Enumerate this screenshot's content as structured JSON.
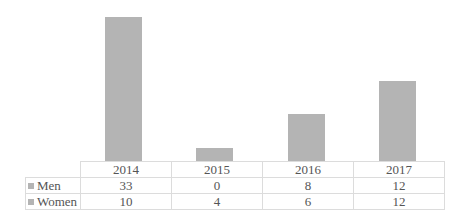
{
  "chart_data": {
    "type": "bar",
    "stacked": true,
    "title": "",
    "xlabel": "",
    "ylabel": "",
    "categories": [
      "2014",
      "2015",
      "2016",
      "2017"
    ],
    "series": [
      {
        "name": "Men",
        "values": [
          33,
          0,
          8,
          12
        ],
        "color": "#b4b4b4"
      },
      {
        "name": "Women",
        "values": [
          10,
          4,
          6,
          12
        ],
        "color": "#b4b4b4"
      }
    ],
    "totals": [
      43,
      4,
      14,
      24
    ],
    "ylim": [
      0,
      48
    ],
    "grid": false,
    "axis_visible": false,
    "legend_position": "data-table-below"
  },
  "table": {
    "headers": [
      "2014",
      "2015",
      "2016",
      "2017"
    ],
    "rows": [
      {
        "label": "Men",
        "values": [
          "33",
          "0",
          "8",
          "12"
        ]
      },
      {
        "label": "Women",
        "values": [
          "10",
          "4",
          "6",
          "12"
        ]
      }
    ]
  }
}
